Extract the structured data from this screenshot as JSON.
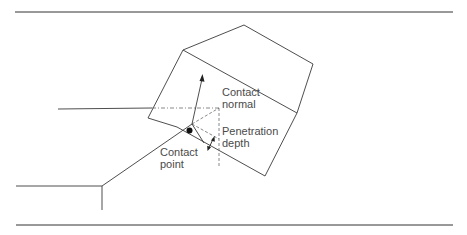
{
  "diagram": {
    "colors": {
      "line": "#3a3a3a",
      "rule": "#333333",
      "dashed": "#6a6a6a",
      "text": "#4a4a4a",
      "dot": "#111111"
    },
    "labels": {
      "contact_normal": {
        "line1": "Contact",
        "line2": "normal"
      },
      "penetration_depth": {
        "line1": "Penetration",
        "line2": "depth"
      },
      "contact_point": {
        "line1": "Contact",
        "line2": "point"
      }
    }
  }
}
